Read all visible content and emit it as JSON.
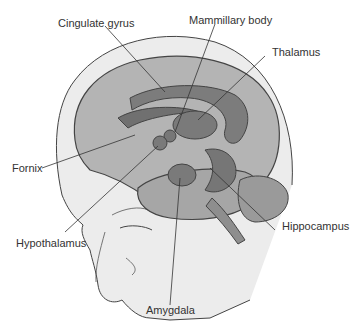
{
  "diagram": {
    "labels": [
      {
        "id": "cingulate-gyrus",
        "text": "Cingulate gyrus"
      },
      {
        "id": "mammillary-body",
        "text": "Mammillary body"
      },
      {
        "id": "thalamus",
        "text": "Thalamus"
      },
      {
        "id": "fornix",
        "text": "Fornix"
      },
      {
        "id": "hypothalamus",
        "text": "Hypothalamus"
      },
      {
        "id": "hippocampus",
        "text": "Hippocampus"
      },
      {
        "id": "amygdala",
        "text": "Amygdala"
      }
    ],
    "colors": {
      "head": "#ebebeb",
      "brain": "#b0b0b0",
      "limbic": "#7a7a7a",
      "outline": "#444444",
      "text": "#333333"
    }
  }
}
